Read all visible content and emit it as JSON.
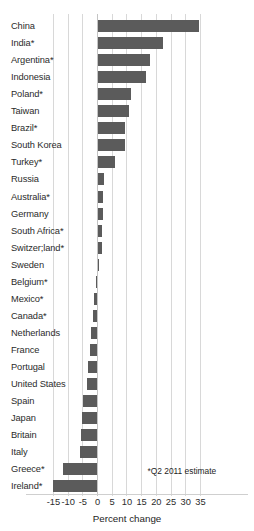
{
  "chart_data": {
    "type": "bar",
    "orientation": "horizontal",
    "title": "",
    "subtitle": "",
    "xlabel": "Percent change",
    "ylabel": "",
    "xlim": [
      -15,
      35
    ],
    "xticks": [
      -15,
      -10,
      -5,
      0,
      5,
      10,
      15,
      20,
      25,
      30,
      35
    ],
    "xticklabels": [
      "-15",
      "-10",
      "-5",
      "0",
      "5",
      "10",
      "15",
      "20",
      "25",
      "30",
      "35"
    ],
    "grid": true,
    "legend": null,
    "bar_color": "#5b5b5b",
    "annotations": [
      "*Q2 2011 estimate"
    ],
    "categories": [
      "China",
      "India*",
      "Argentina*",
      "Indonesia",
      "Poland*",
      "Taiwan",
      "Brazil*",
      "South Korea",
      "Turkey*",
      "Russia",
      "Australia*",
      "Germany",
      "South Africa*",
      "Switzer;land*",
      "Sweden",
      "Belgium*",
      "Mexico*",
      "Canada*",
      "Netherlands",
      "France",
      "Portugal",
      "United States",
      "Spain",
      "Japan",
      "Britain",
      "Italy",
      "Greece*",
      "Ireland*"
    ],
    "values": [
      34.5,
      22.3,
      17.8,
      16.5,
      11.5,
      10.6,
      9.5,
      9.3,
      6.0,
      2.2,
      2.0,
      1.8,
      1.6,
      1.4,
      0.5,
      -0.6,
      -1.1,
      -1.4,
      -2.1,
      -2.6,
      -3.3,
      -3.5,
      -5.1,
      -5.3,
      -5.6,
      -5.8,
      -11.8,
      -15.0
    ]
  },
  "axis": {
    "xlabel": "Percent change"
  },
  "footnote": {
    "text": "*Q2 2011 estimate"
  }
}
